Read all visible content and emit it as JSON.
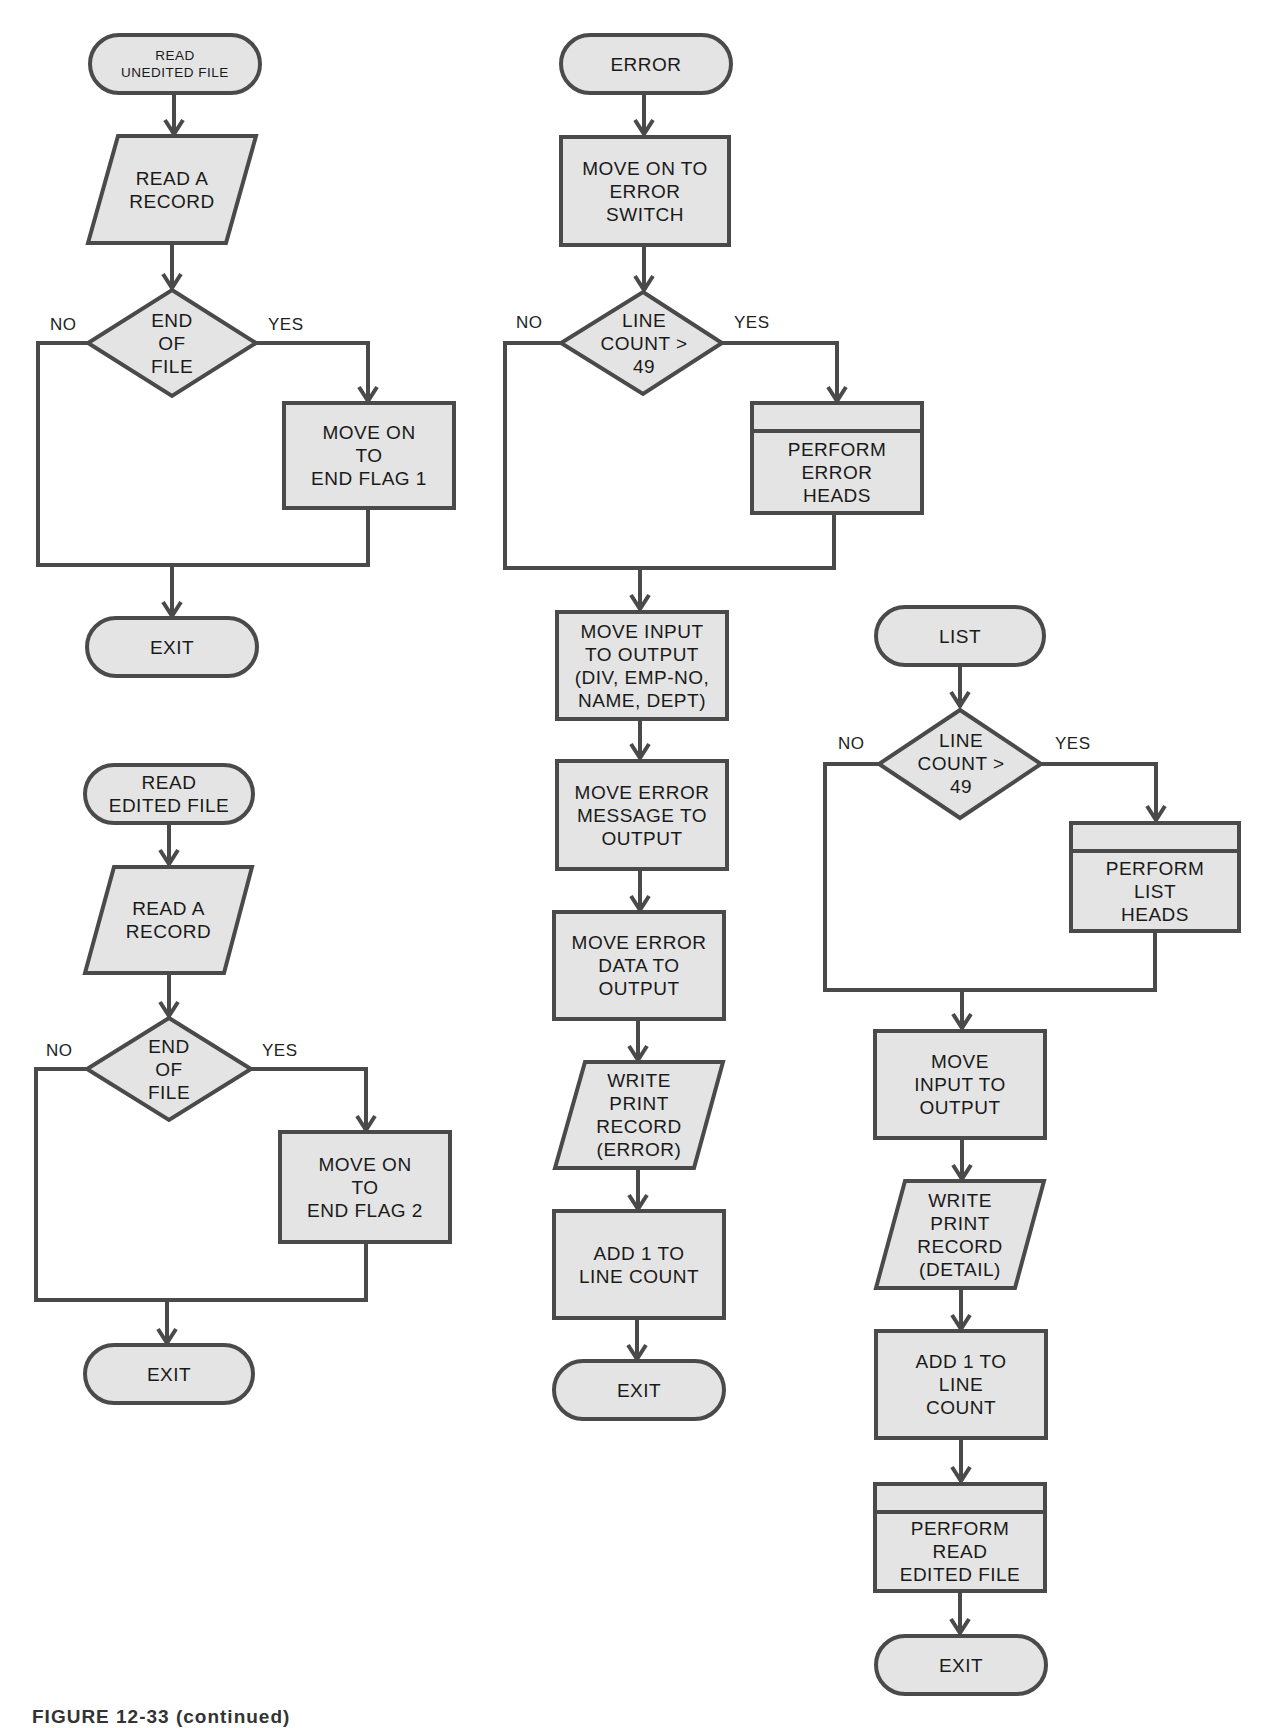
{
  "figure": {
    "caption": "FIGURE 12-33 (continued)"
  },
  "labels": {
    "no": "NO",
    "yes": "YES"
  },
  "colors": {
    "shape_fill": "#e4e4e4",
    "stroke": "#4a4a4a",
    "text": "#1a1a1a"
  },
  "flowcharts": [
    {
      "id": "read-unedited-file",
      "nodes": [
        {
          "type": "terminal",
          "text": "READ\nUNEDITED FILE"
        },
        {
          "type": "io",
          "text": "READ A\nRECORD"
        },
        {
          "type": "decision",
          "text": "END\nOF\nFILE"
        },
        {
          "type": "process",
          "text": "MOVE ON\nTO\nEND FLAG 1"
        },
        {
          "type": "terminal",
          "text": "EXIT"
        }
      ]
    },
    {
      "id": "read-edited-file",
      "nodes": [
        {
          "type": "terminal",
          "text": "READ\nEDITED FILE"
        },
        {
          "type": "io",
          "text": "READ A\nRECORD"
        },
        {
          "type": "decision",
          "text": "END\nOF\nFILE"
        },
        {
          "type": "process",
          "text": "MOVE ON\nTO\nEND FLAG 2"
        },
        {
          "type": "terminal",
          "text": "EXIT"
        }
      ]
    },
    {
      "id": "error",
      "nodes": [
        {
          "type": "terminal",
          "text": "ERROR"
        },
        {
          "type": "process",
          "text": "MOVE ON TO\nERROR\nSWITCH"
        },
        {
          "type": "decision",
          "text": "LINE\nCOUNT >\n49"
        },
        {
          "type": "predefined",
          "text": "PERFORM\nERROR\nHEADS"
        },
        {
          "type": "process",
          "text": "MOVE INPUT\nTO OUTPUT\n(DIV, EMP-NO,\nNAME, DEPT)"
        },
        {
          "type": "process",
          "text": "MOVE ERROR\nMESSAGE TO\nOUTPUT"
        },
        {
          "type": "process",
          "text": "MOVE ERROR\nDATA TO\nOUTPUT"
        },
        {
          "type": "io",
          "text": "WRITE\nPRINT\nRECORD\n(ERROR)"
        },
        {
          "type": "process",
          "text": "ADD 1 TO\nLINE COUNT"
        },
        {
          "type": "terminal",
          "text": "EXIT"
        }
      ]
    },
    {
      "id": "list",
      "nodes": [
        {
          "type": "terminal",
          "text": "LIST"
        },
        {
          "type": "decision",
          "text": "LINE\nCOUNT >\n49"
        },
        {
          "type": "predefined",
          "text": "PERFORM\nLIST\nHEADS"
        },
        {
          "type": "process",
          "text": "MOVE\nINPUT TO\nOUTPUT"
        },
        {
          "type": "io",
          "text": "WRITE\nPRINT\nRECORD\n(DETAIL)"
        },
        {
          "type": "process",
          "text": "ADD 1 TO\nLINE\nCOUNT"
        },
        {
          "type": "predefined",
          "text": "PERFORM\nREAD\nEDITED FILE"
        },
        {
          "type": "terminal",
          "text": "EXIT"
        }
      ]
    }
  ]
}
